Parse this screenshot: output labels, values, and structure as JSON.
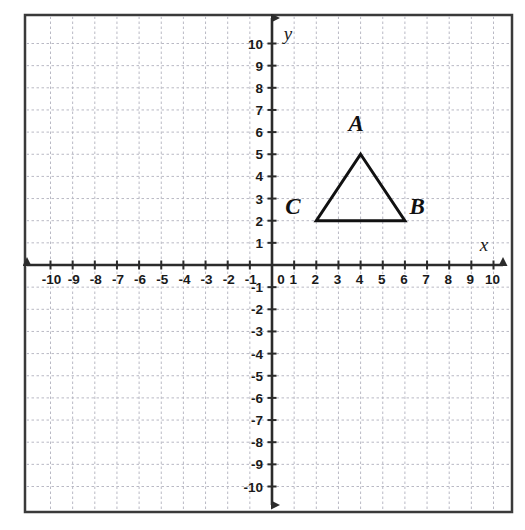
{
  "figure": {
    "kind": "coordinate-plane-with-triangle",
    "background_color": "#ffffff",
    "border_color": "#3a3a3a",
    "grid_color": "#b9b9c4",
    "axis_color": "#2b2b2b",
    "shape_color": "#111111"
  },
  "axes": {
    "x_label": "x",
    "y_label": "y",
    "x_min": -10,
    "x_max": 10,
    "y_min": -10,
    "y_max": 10,
    "step": 1,
    "origin_label": "0",
    "x_ticks_negative": [
      "-10",
      "-9",
      "-8",
      "-7",
      "-6",
      "-5",
      "-4",
      "-3",
      "-2",
      "-1"
    ],
    "x_ticks_positive": [
      "1",
      "2",
      "3",
      "4",
      "5",
      "6",
      "7",
      "8",
      "9",
      "10"
    ],
    "y_ticks_positive": [
      "1",
      "2",
      "3",
      "4",
      "5",
      "6",
      "7",
      "8",
      "9",
      "10"
    ],
    "y_ticks_negative": [
      "-1",
      "-2",
      "-3",
      "-4",
      "-5",
      "-6",
      "-7",
      "-8",
      "-9",
      "-10"
    ]
  },
  "shape": {
    "name": "triangle-ABC",
    "vertices": [
      {
        "label": "A",
        "x": 4,
        "y": 5,
        "label_dx": -0.2,
        "label_dy": 1.05
      },
      {
        "label": "B",
        "x": 6,
        "y": 2,
        "label_dx": 0.55,
        "label_dy": 0.28
      },
      {
        "label": "C",
        "x": 2,
        "y": 2,
        "label_dx": -1.05,
        "label_dy": 0.28
      }
    ]
  }
}
